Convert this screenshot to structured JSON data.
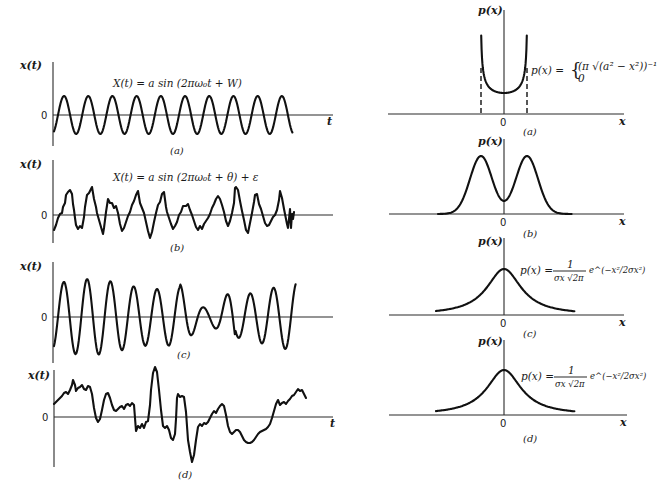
{
  "figure": {
    "left_column_title": "Sample time histories",
    "right_column_title": "Probability density functions",
    "left_panels": [
      {
        "id": "a",
        "caption": "(a)",
        "y_label": "x(t)",
        "x_label": "t",
        "zero_label": "0",
        "equation": "X(t) = a sin (2πω₀t + W)",
        "description": "pure sine wave"
      },
      {
        "id": "b",
        "caption": "(b)",
        "y_label": "x(t)",
        "x_label": "t",
        "zero_label": "0",
        "equation": "X(t) = a sin (2πω₀t + θ) + ε",
        "description": "sine wave plus random noise"
      },
      {
        "id": "c",
        "caption": "(c)",
        "y_label": "x(t)",
        "x_label": "t",
        "zero_label": "0",
        "equation": "",
        "description": "narrow-band random"
      },
      {
        "id": "d",
        "caption": "(d)",
        "y_label": "x(t)",
        "x_label": "t",
        "zero_label": "0",
        "equation": "",
        "description": "wide-band random"
      }
    ],
    "right_panels": [
      {
        "id": "a",
        "caption": "(a)",
        "y_label": "p(x)",
        "x_label": "x",
        "zero_label": "0",
        "equation_lhs": "p(x) =",
        "equation_line1": "(π √(a² − x²))⁻¹",
        "equation_line2": "0",
        "description": "arcsine density of sine wave"
      },
      {
        "id": "b",
        "caption": "(b)",
        "y_label": "p(x)",
        "x_label": "x",
        "zero_label": "0",
        "equation_lhs": "",
        "description": "bimodal density of sine plus noise"
      },
      {
        "id": "c",
        "caption": "(c)",
        "y_label": "p(x)",
        "x_label": "x",
        "zero_label": "0",
        "equation_lhs": "p(x) =",
        "equation_num": "1",
        "equation_den": "σx √2π",
        "equation_exp": "e^(−x²/2σx²)",
        "description": "Gaussian density"
      },
      {
        "id": "d",
        "caption": "(d)",
        "y_label": "p(x)",
        "x_label": "x",
        "zero_label": "0",
        "equation_lhs": "p(x) =",
        "equation_num": "1",
        "equation_den": "σx √2π",
        "equation_exp": "e^(−x²/2σx²)",
        "description": "Gaussian density"
      }
    ]
  },
  "colors": {
    "background": "#ffffff",
    "ink": "#111111",
    "axis": "#2a2a2a"
  }
}
